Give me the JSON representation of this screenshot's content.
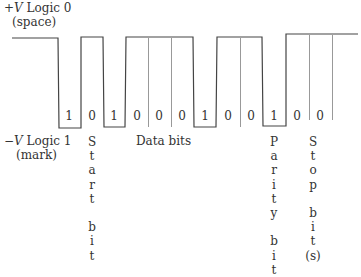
{
  "top_label": {
    "sign": "+",
    "var": "V",
    "text": " Logic 0",
    "sub": "(space)"
  },
  "bottom_label": {
    "sign": "−",
    "var": "V",
    "text": " Logic 1",
    "sub": "(mark)"
  },
  "bits": [
    "1",
    "0",
    "1",
    "0",
    "0",
    "0",
    "1",
    "0",
    "0",
    "1",
    "0",
    "0"
  ],
  "bit_x": [
    63,
    86,
    108,
    131,
    153,
    176,
    199,
    222,
    245,
    268,
    291,
    314
  ],
  "data_bits_label": "Data bits",
  "start_bit_label": [
    "S",
    "t",
    "a",
    "r",
    "t",
    "",
    "b",
    "i",
    "t"
  ],
  "parity_bit_label": [
    "P",
    "a",
    "r",
    "i",
    "t",
    "y",
    "",
    "b",
    "i",
    "t"
  ],
  "stop_bit_label": [
    "S",
    "t",
    "o",
    "p",
    "",
    "b",
    "i",
    "t",
    "(s)"
  ],
  "colors": {
    "line": "#444444",
    "grid": "#999999",
    "text": "#333333"
  }
}
